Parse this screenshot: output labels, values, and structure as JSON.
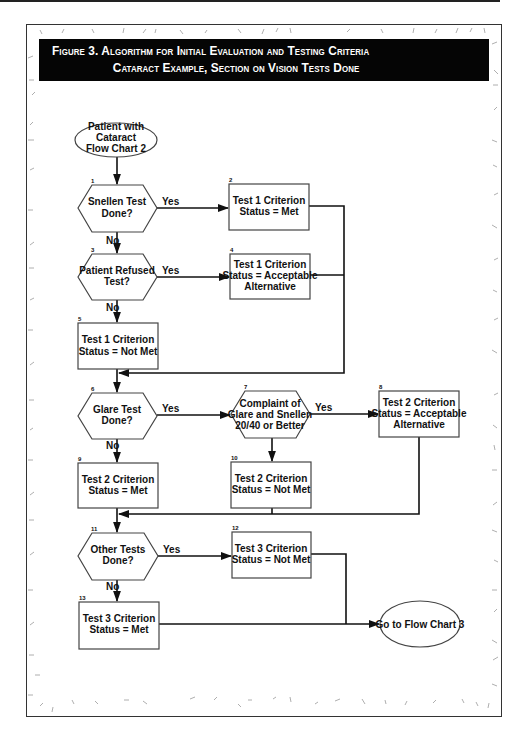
{
  "figure": {
    "title_line1": "Figure 3.  Algorithm for Initial Evaluation and Testing Criteria",
    "title_line2": "Cataract Example, Section on Vision Tests Done"
  },
  "flowchart": {
    "start": {
      "label_lines": [
        "Patient with",
        "Cataract",
        "Flow Chart 2"
      ]
    },
    "end": {
      "label_lines": [
        "Go to Flow Chart 3"
      ]
    },
    "nodes": [
      {
        "num": "1",
        "type": "decision",
        "label_lines": [
          "Snellen Test",
          "Done?"
        ]
      },
      {
        "num": "2",
        "type": "process",
        "label_lines": [
          "Test 1 Criterion",
          "Status = Met"
        ]
      },
      {
        "num": "3",
        "type": "decision",
        "label_lines": [
          "Patient Refused",
          "Test?"
        ]
      },
      {
        "num": "4",
        "type": "process",
        "label_lines": [
          "Test 1 Criterion",
          "Status = Acceptable",
          "Alternative"
        ]
      },
      {
        "num": "5",
        "type": "process",
        "label_lines": [
          "Test 1 Criterion",
          "Status = Not Met"
        ]
      },
      {
        "num": "6",
        "type": "decision",
        "label_lines": [
          "Glare Test",
          "Done?"
        ]
      },
      {
        "num": "7",
        "type": "decision",
        "label_lines": [
          "Complaint of",
          "Glare and Snellen",
          "20/40 or Better"
        ]
      },
      {
        "num": "8",
        "type": "process",
        "label_lines": [
          "Test 2 Criterion",
          "Status = Acceptable",
          "Alternative"
        ]
      },
      {
        "num": "9",
        "type": "process",
        "label_lines": [
          "Test 2 Criterion",
          "Status = Met"
        ]
      },
      {
        "num": "10",
        "type": "process",
        "label_lines": [
          "Test 2 Criterion",
          "Status = Not Met"
        ]
      },
      {
        "num": "11",
        "type": "decision",
        "label_lines": [
          "Other Tests",
          "Done?"
        ]
      },
      {
        "num": "12",
        "type": "process",
        "label_lines": [
          "Test 3 Criterion",
          "Status = Not Met"
        ]
      },
      {
        "num": "13",
        "type": "process",
        "label_lines": [
          "Test 3 Criterion",
          "Status = Met"
        ]
      }
    ],
    "edge_labels": {
      "yes": "Yes",
      "no": "No"
    }
  }
}
